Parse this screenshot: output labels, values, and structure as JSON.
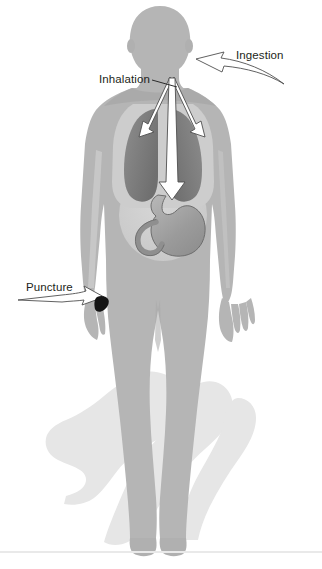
{
  "diagram": {
    "background_color": "#ffffff",
    "labels": [
      {
        "id": "ingestion",
        "text": "Ingestion",
        "target": "mouth",
        "arrow": "curved-outline-arrow-pointing-left",
        "x": 236,
        "y": 49
      },
      {
        "id": "inhalation",
        "text": "Inhalation",
        "target": "lungs",
        "arrow": "leader-line",
        "x": 99,
        "y": 73
      },
      {
        "id": "puncture",
        "text": "Puncture",
        "target": "left-hand",
        "arrow": "curved-outline-arrow-pointing-right",
        "x": 26,
        "y": 281
      }
    ],
    "pathways": [
      {
        "id": "airway-left-lung",
        "from": "throat",
        "to": "left-lung",
        "style": "white-outline-arrow"
      },
      {
        "id": "airway-right-lung",
        "from": "throat",
        "to": "right-lung",
        "style": "white-outline-arrow"
      },
      {
        "id": "esophagus-stomach",
        "from": "throat",
        "to": "stomach",
        "style": "white-outline-arrow"
      }
    ],
    "organs": [
      {
        "id": "left-lung",
        "name": "Left lung",
        "color": "#7d7d7d"
      },
      {
        "id": "right-lung",
        "name": "Right lung",
        "color": "#7d7d7d"
      },
      {
        "id": "stomach",
        "name": "Stomach",
        "color": "#a0a0a0"
      },
      {
        "id": "intestine",
        "name": "Intestine",
        "color": "#a0a0a0"
      },
      {
        "id": "abdomen",
        "name": "Abdominal cavity",
        "color": "#cfcfcf"
      }
    ],
    "marks": [
      {
        "id": "puncture-wound",
        "name": "Puncture wound on hand",
        "color": "#1a1a1a"
      }
    ],
    "colors": {
      "body": "#b5b5b5",
      "body_shade": "#a6a6a6",
      "body_highlight": "#c6c6c6",
      "cavity": "#cfcfcf",
      "lung": "#7d7d7d",
      "organ": "#a3a3a3",
      "shadow": "#e4e4e4",
      "arrow_fill": "#ffffff",
      "arrow_stroke": "#545454",
      "label_text": "#231f20",
      "baseline": "#e9e9e9",
      "wound": "#1a1a1a"
    }
  }
}
